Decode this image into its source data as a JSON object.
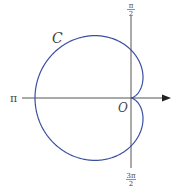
{
  "diagram": {
    "type": "polar-curve",
    "curve": {
      "name": "C",
      "equation": "r = a(1 - cos θ)",
      "kind": "cardioid",
      "color": "#3a4fa0"
    },
    "origin_label": "O",
    "axis_labels": {
      "pi": "π",
      "pi_over_2_num": "π",
      "pi_over_2_den": "2",
      "three_pi_over_2_num": "3π",
      "three_pi_over_2_den": "2"
    },
    "axis_color": "#555555"
  }
}
